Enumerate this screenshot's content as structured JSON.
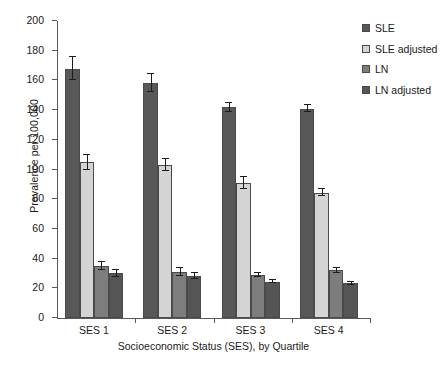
{
  "chart_data": {
    "type": "bar",
    "title": "",
    "xlabel": "Socioeconomic Status (SES), by Quartile",
    "ylabel": "Prevalence per 100,000",
    "categories": [
      "SES 1",
      "SES 2",
      "SES 3",
      "SES 4"
    ],
    "ylim": [
      0,
      200
    ],
    "yticks": [
      0,
      20,
      40,
      60,
      80,
      100,
      120,
      140,
      160,
      180,
      200
    ],
    "grid": false,
    "legend_position": "top-right",
    "series": [
      {
        "name": "SLE",
        "color": "#585858",
        "values": [
          168,
          158,
          142,
          141
        ],
        "errors": [
          7.5,
          6,
          3,
          2.5
        ]
      },
      {
        "name": "SLE adjusted",
        "color": "#d4d4d4",
        "values": [
          105,
          103,
          91,
          84.5
        ],
        "errors": [
          5,
          4,
          4,
          2.5
        ]
      },
      {
        "name": "LN",
        "color": "#7d7d7d",
        "values": [
          35,
          31,
          29,
          32
        ],
        "errors": [
          3,
          2.5,
          1.5,
          1.5
        ]
      },
      {
        "name": "LN adjusted",
        "color": "#555555",
        "values": [
          30,
          28,
          24.5,
          23.5
        ],
        "errors": [
          2.5,
          2,
          1,
          1
        ]
      }
    ]
  }
}
